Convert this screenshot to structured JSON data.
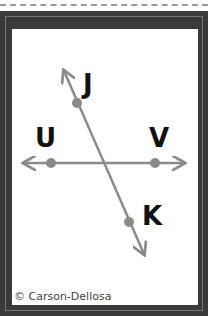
{
  "card": {
    "labels": {
      "j": "J",
      "u": "U",
      "v": "V",
      "k": "K"
    },
    "copyright": "© Carson-Dellosa"
  },
  "colors": {
    "line": "#8a8a8a",
    "frame": "#3a3a3a",
    "text": "#111111"
  }
}
